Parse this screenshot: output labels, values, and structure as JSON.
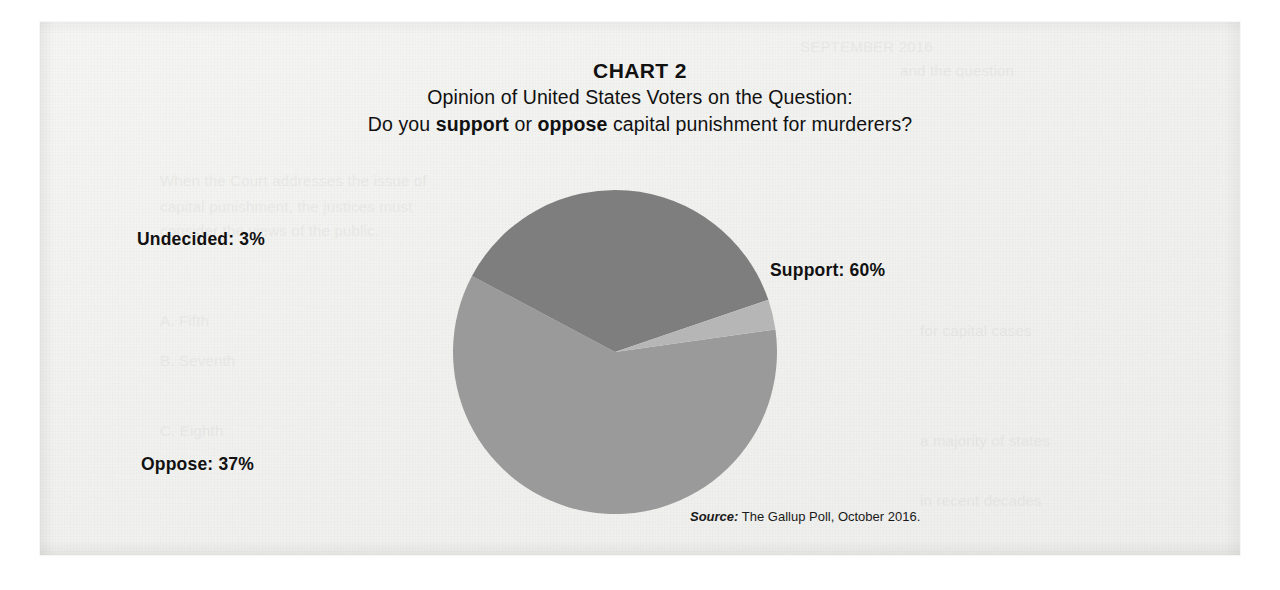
{
  "figure": {
    "chart_label": "CHART 2",
    "subtitle_line1": "Opinion of United States Voters on the Question:",
    "question_prefix": "Do you ",
    "question_emphasis_1": "support",
    "question_middle": " or ",
    "question_emphasis_2": "oppose",
    "question_suffix": " capital punishment for murderers?"
  },
  "labels": {
    "undecided": "Undecided: 3%",
    "support": "Support: 60%",
    "oppose": "Oppose: 37%"
  },
  "source": {
    "label": "Source:",
    "text": " The Gallup Poll, October 2016."
  },
  "colors": {
    "support": "#9a9a9a",
    "oppose": "#7e7e7e",
    "undecided": "#b6b6b6",
    "paper": "#f1f1ef",
    "text": "#111111"
  },
  "chart_data": {
    "type": "pie",
    "title": "CHART 2",
    "subtitle": "Opinion of United States Voters on the Question: Do you support or oppose capital punishment for murderers?",
    "categories": [
      "Support",
      "Oppose",
      "Undecided"
    ],
    "values": [
      60,
      37,
      3
    ],
    "unit": "%",
    "slice_colors": [
      "#9a9a9a",
      "#7e7e7e",
      "#b6b6b6"
    ],
    "start_angle_deg": -8,
    "direction": "clockwise",
    "legend": "none",
    "data_labels": [
      "Support: 60%",
      "Oppose: 37%",
      "Undecided: 3%"
    ],
    "source": "Source: The Gallup Poll, October 2016."
  }
}
